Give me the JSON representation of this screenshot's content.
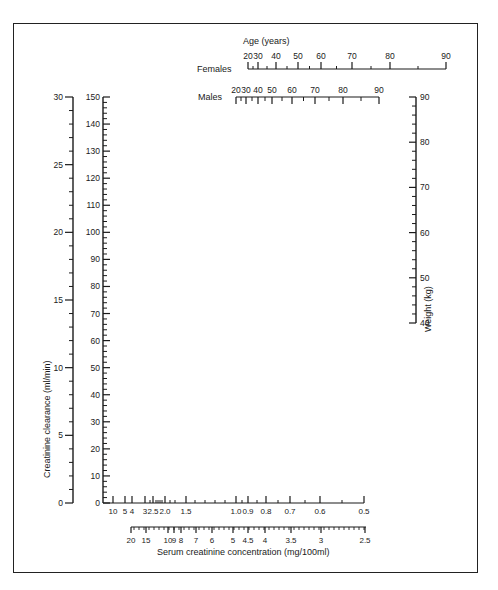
{
  "chart_data": {
    "type": "nomogram",
    "title": "",
    "axes": {
      "clearance_low": {
        "label": "Creatinine clearance (ml/min)",
        "range": [
          0,
          30
        ],
        "ticks": [
          0,
          5,
          10,
          15,
          20,
          25,
          30
        ],
        "tick_labels": [
          "0",
          "5",
          "10",
          "15",
          "20",
          "25",
          "30"
        ]
      },
      "clearance_high": {
        "label": "",
        "range": [
          0,
          150
        ],
        "ticks": [
          0,
          10,
          20,
          30,
          40,
          50,
          60,
          70,
          80,
          90,
          100,
          110,
          120,
          130,
          140,
          150
        ],
        "tick_labels": [
          "0",
          "10",
          "20",
          "30",
          "40",
          "50",
          "60",
          "70",
          "80",
          "90",
          "100",
          "110",
          "120",
          "130",
          "140",
          "150"
        ]
      },
      "age_title": "Age (years)",
      "age_females": {
        "label": "Females",
        "ticks": [
          20,
          30,
          40,
          50,
          60,
          70,
          80,
          90
        ],
        "tick_labels": [
          "20",
          "30",
          "40",
          "50",
          "60",
          "70",
          "80",
          "90"
        ]
      },
      "age_males": {
        "label": "Males",
        "ticks": [
          20,
          30,
          40,
          50,
          60,
          70,
          80,
          90
        ],
        "tick_labels": [
          "20",
          "30",
          "40",
          "50",
          "60",
          "70",
          "80",
          "90"
        ]
      },
      "weight": {
        "label": "Weight (kg)",
        "range": [
          40,
          90
        ],
        "ticks": [
          40,
          50,
          60,
          70,
          80,
          90
        ],
        "tick_labels": [
          "40",
          "50",
          "60",
          "70",
          "80",
          "90"
        ]
      },
      "serum_creatinine_mg": {
        "label": "Serum creatinine concentration (mg/100ml)",
        "tick_labels": [
          "10",
          "5",
          "4",
          "3",
          "2.5",
          "2.0",
          "1.5",
          "1.0",
          "0.9",
          "0.8",
          "0.7",
          "0.6",
          "0.5"
        ],
        "values": [
          10,
          5,
          4,
          3,
          2.5,
          2.0,
          1.5,
          1.0,
          0.9,
          0.8,
          0.7,
          0.6,
          0.5
        ]
      },
      "serum_creatinine_second": {
        "label": "",
        "tick_labels": [
          "20",
          "15",
          "10",
          "9",
          "8",
          "7",
          "6",
          "5",
          "4.5",
          "4",
          "3.5",
          "3",
          "2.5"
        ],
        "values": [
          20,
          15,
          10,
          9,
          8,
          7,
          6,
          5,
          4.5,
          4,
          3.5,
          3,
          2.5
        ]
      }
    },
    "grid": false
  },
  "labels": {
    "age_title": "Age (years)",
    "females": "Females",
    "males": "Males",
    "weight_axis": "Weight (kg)",
    "clearance_axis": "Creatinine clearance (ml/min)",
    "serum_axis": "Serum creatinine concentration (mg/100ml)"
  },
  "colors": {
    "ink": "#1a1a1a",
    "background": "#ffffff"
  }
}
